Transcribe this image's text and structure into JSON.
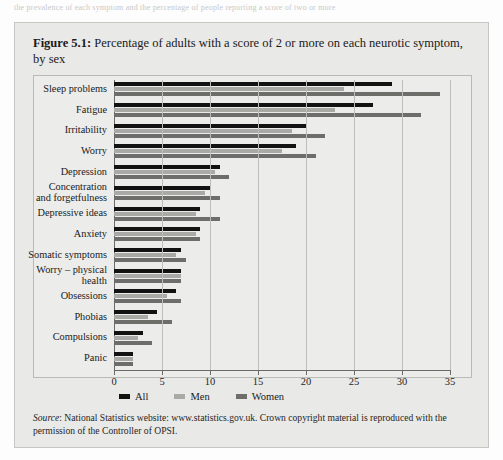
{
  "page": {
    "top_fragment": "the prevalence of each symptom and the percentage of people reporting a score of two or more"
  },
  "figure": {
    "number": "Figure 5.1:",
    "title_rest": " Percentage of adults with a score of 2 or more on each neurotic symptom, by sex",
    "source_label": "Source",
    "source_text": ": National Statistics website: www.statistics.gov.uk. Crown copyright material is reproduced with the permission of the Controller of OPSI."
  },
  "colors": {
    "all": "#121212",
    "men": "#a9a9a6",
    "women": "#6d6d6a",
    "figure_bg": "#e9e9e7",
    "plot_bg": "#ececea",
    "grid": "#bdbdba",
    "axis": "#6a6a68"
  },
  "chart_data": {
    "type": "bar",
    "orientation": "horizontal",
    "title": "Figure 5.1: Percentage of adults with a score of 2 or more on each neurotic symptom, by sex",
    "xlabel": "",
    "ylabel": "",
    "xlim": [
      0,
      35
    ],
    "xticks": [
      0,
      5,
      10,
      15,
      20,
      25,
      30,
      35
    ],
    "grid": true,
    "legend_position": "bottom-left",
    "categories": [
      "Sleep problems",
      "Fatigue",
      "Irritability",
      "Worry",
      "Depression",
      "Concentration\nand forgetfulness",
      "Depressive ideas",
      "Anxiety",
      "Somatic symptoms",
      "Worry – physical\nhealth",
      "Obsessions",
      "Phobias",
      "Compulsions",
      "Panic"
    ],
    "series": [
      {
        "name": "All",
        "color": "#121212",
        "values": [
          29,
          27,
          20,
          19,
          11,
          10,
          9,
          9,
          7,
          7,
          6.5,
          4.5,
          3,
          2
        ]
      },
      {
        "name": "Men",
        "color": "#a9a9a6",
        "values": [
          24,
          23,
          18.5,
          17.5,
          10.5,
          9.5,
          8.5,
          8.5,
          6.5,
          7,
          5.5,
          3.5,
          2.5,
          2
        ]
      },
      {
        "name": "Women",
        "color": "#6d6d6a",
        "values": [
          34,
          32,
          22,
          21,
          12,
          11,
          11,
          9,
          7.5,
          7,
          7,
          6,
          4,
          2
        ]
      }
    ]
  }
}
